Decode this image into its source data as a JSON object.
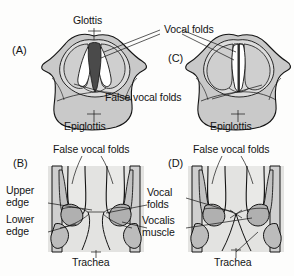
{
  "figure": {
    "background_color": "#fdfdfc",
    "ink_color": "#141414",
    "tissue_fill": "#c9c9c9",
    "tissue_fill_light": "#dcdcdc",
    "muscle_fill": "#b0b0b0",
    "glottis_dark_fill": "#4a4a4a",
    "fold_white_fill": "#ffffff"
  },
  "panels": [
    {
      "id": "A",
      "id_label": "(A)",
      "view": "laryngoscopic-abducted",
      "description": "Superior laryngoscopic view with vocal folds abducted, glottis open as a dark triangle"
    },
    {
      "id": "C",
      "id_label": "(C)",
      "view": "laryngoscopic-adducted",
      "description": "Superior laryngoscopic view with vocal folds adducted, glottis closed to a narrow slit"
    },
    {
      "id": "B",
      "id_label": "(B)",
      "view": "coronal-abducted",
      "description": "Coronal section through larynx with vocal folds apart"
    },
    {
      "id": "D",
      "id_label": "(D)",
      "view": "coronal-adducted",
      "description": "Coronal section through larynx with vocal folds together"
    }
  ],
  "labels": {
    "glottis": "Glottis",
    "vocal_folds": "Vocal folds",
    "false_vocal_folds": "False vocal folds",
    "epiglottis": "Epiglottis",
    "upper_edge_line1": "Upper",
    "upper_edge_line2": "edge",
    "lower_edge_line1": "Lower",
    "lower_edge_line2": "edge",
    "vocal_folds_line1": "Vocal",
    "vocal_folds_line2": "folds",
    "vocalis_muscle_line1": "Vocalis",
    "vocalis_muscle_line2": "muscle",
    "trachea": "Trachea"
  }
}
